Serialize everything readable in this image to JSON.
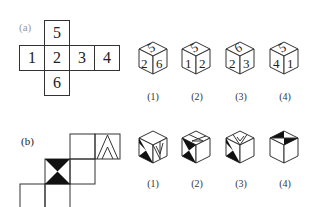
{
  "part_a": {
    "label": "(a)",
    "net": {
      "top": "5",
      "row": [
        "1",
        "2",
        "3",
        "4"
      ],
      "bottom": "6"
    },
    "options": [
      {
        "caption": "(1)",
        "top": "5",
        "left": "2",
        "right": "6"
      },
      {
        "caption": "(2)",
        "top": "5",
        "left": "1",
        "right": "2"
      },
      {
        "caption": "(3)",
        "top": "6",
        "left": "2",
        "right": "3"
      },
      {
        "caption": "(4)",
        "top": "5",
        "left": "4",
        "right": "1"
      }
    ]
  },
  "part_b": {
    "label": "(b)",
    "options": [
      {
        "caption": "(1)"
      },
      {
        "caption": "(2)"
      },
      {
        "caption": "(3)"
      },
      {
        "caption": "(4)"
      }
    ]
  }
}
